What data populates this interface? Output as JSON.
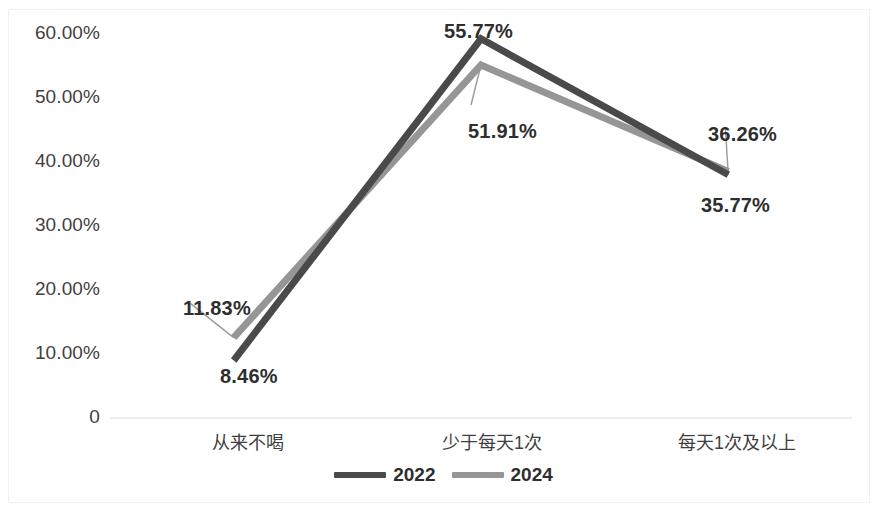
{
  "chart_data": {
    "type": "line",
    "title": "",
    "xlabel": "",
    "ylabel": "",
    "categories": [
      "从来不喝",
      "少于每天1次",
      "每天1次及以上"
    ],
    "series": [
      {
        "name": "2022",
        "color": "#4a4a4a",
        "values": [
          8.46,
          55.77,
          35.77
        ],
        "labels": [
          "8.46%",
          "55.77%",
          "35.77%"
        ]
      },
      {
        "name": "2024",
        "color": "#969696",
        "values": [
          11.83,
          51.91,
          36.26
        ],
        "labels": [
          "11.83%",
          "51.91%",
          "36.26%"
        ]
      }
    ],
    "y_ticks": [
      "60.00%",
      "50.00%",
      "40.00%",
      "30.00%",
      "20.00%",
      "10.00%",
      "0"
    ],
    "y_tick_values": [
      60,
      50,
      40,
      30,
      20,
      10,
      0
    ],
    "ylim": [
      0,
      60
    ],
    "grid": false,
    "legend_position": "bottom"
  },
  "axis": {
    "y": {
      "t0": "60.00%",
      "t1": "50.00%",
      "t2": "40.00%",
      "t3": "30.00%",
      "t4": "20.00%",
      "t5": "10.00%",
      "t6": "0"
    },
    "x": {
      "c0": "从来不喝",
      "c1": "少于每天1次",
      "c2": "每天1次及以上"
    }
  },
  "labels": {
    "s0_p0": "8.46%",
    "s0_p1": "55.77%",
    "s0_p2": "35.77%",
    "s1_p0": "11.83%",
    "s1_p1": "51.91%",
    "s1_p2": "36.26%"
  },
  "legend": {
    "item0": "2022",
    "item1": "2024"
  },
  "colors": {
    "series_2022": "#4a4a4a",
    "series_2024": "#969696",
    "axis_line": "#d9d9d9",
    "frame": "#f1f1f1",
    "text": "#3f3f3f"
  }
}
